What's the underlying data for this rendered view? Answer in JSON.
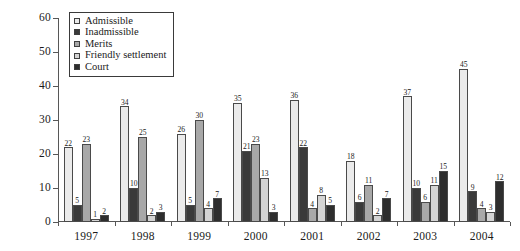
{
  "chart_data": {
    "type": "bar",
    "title": "",
    "subtitle": "",
    "xlabel": "",
    "ylabel": "",
    "ylim": [
      0,
      60
    ],
    "yticks": [
      0,
      10,
      20,
      30,
      40,
      50,
      60
    ],
    "grid": false,
    "legend_position": "top-left",
    "categories": [
      "1997",
      "1998",
      "1999",
      "2000",
      "2001",
      "2002",
      "2003",
      "2004"
    ],
    "series": [
      {
        "name": "Admissible",
        "color": "#ebebeb",
        "values": [
          22,
          34,
          26,
          35,
          36,
          18,
          37,
          45
        ]
      },
      {
        "name": "Inadmissible",
        "color": "#3a3a3a",
        "values": [
          5,
          10,
          5,
          21,
          22,
          6,
          10,
          9
        ]
      },
      {
        "name": "Merits",
        "color": "#a8a8a8",
        "values": [
          23,
          25,
          30,
          23,
          4,
          11,
          6,
          4
        ]
      },
      {
        "name": "Friendly settlement",
        "color": "#d4d4d4",
        "values": [
          1,
          2,
          4,
          13,
          8,
          2,
          11,
          3
        ]
      },
      {
        "name": "Court",
        "color": "#2e2e2e",
        "values": [
          2,
          3,
          7,
          3,
          5,
          7,
          15,
          12
        ]
      }
    ]
  }
}
